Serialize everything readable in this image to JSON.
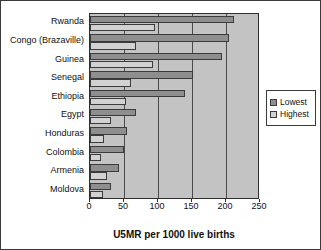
{
  "chart_data": {
    "type": "bar",
    "orientation": "horizontal",
    "title": "",
    "xlabel": "U5MR per 1000 live births",
    "ylabel": "",
    "xlim": [
      0,
      250
    ],
    "xticks": [
      0,
      50,
      100,
      150,
      200,
      250
    ],
    "grid": true,
    "legend_position": "right",
    "categories": [
      "Rwanda",
      "Congo (Brazaville)",
      "Guinea",
      "Senegal",
      "Ethiopia",
      "Egypt",
      "Honduras",
      "Colombia",
      "Armenia",
      "Moldova"
    ],
    "series": [
      {
        "name": "Lowest",
        "color": "#8e8e8e",
        "values": [
          212,
          205,
          194,
          152,
          139,
          67,
          54,
          50,
          43,
          31
        ]
      },
      {
        "name": "Highest",
        "color": "#d2d2d2",
        "values": [
          95,
          67,
          92,
          60,
          53,
          31,
          21,
          16,
          25,
          19
        ]
      }
    ]
  },
  "legend": {
    "items": [
      {
        "label": "Lowest",
        "swatch": "lowest"
      },
      {
        "label": "Highest",
        "swatch": "highest"
      }
    ]
  }
}
